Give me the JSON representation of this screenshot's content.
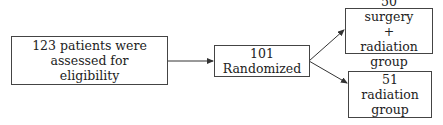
{
  "diagram": {
    "type": "flowchart",
    "nodes": [
      {
        "id": "assessed",
        "label": "123 patients were assessed for eligibility"
      },
      {
        "id": "randomized",
        "label": "101 Randomized"
      },
      {
        "id": "surgery_radiation",
        "label": "50 surgery + radiation group"
      },
      {
        "id": "radiation",
        "label": "51 radiation group"
      }
    ],
    "edges": [
      {
        "from": "assessed",
        "to": "randomized"
      },
      {
        "from": "randomized",
        "to": "surgery_radiation"
      },
      {
        "from": "randomized",
        "to": "radiation"
      }
    ]
  }
}
